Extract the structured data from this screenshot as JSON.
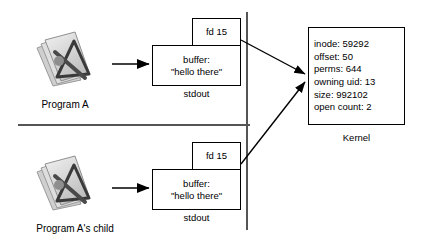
{
  "diagram": {
    "divider_color": "#555555",
    "line_color": "#000000",
    "background": "#ffffff"
  },
  "parent_process": {
    "icon_name": "program-document-icon",
    "label": "Program A",
    "fd_label": "fd 15",
    "buffer_title": "buffer:",
    "buffer_value": "\"hello there\"",
    "stream_label": "stdout"
  },
  "child_process": {
    "icon_name": "program-document-icon",
    "label": "Program A's child",
    "fd_label": "fd 15",
    "buffer_title": "buffer:",
    "buffer_value": "\"hello there\"",
    "stream_label": "stdout"
  },
  "kernel": {
    "label": "Kernel",
    "fields": [
      "inode: 59292",
      "offset: 50",
      "perms: 644",
      "owning uid: 13",
      "size: 992102",
      "open count: 2"
    ],
    "inode": "inode: 59292",
    "offset": "offset: 50",
    "perms": "perms: 644",
    "owning_uid": "owning uid: 13",
    "size": "size: 992102",
    "open_count": "open count: 2"
  }
}
